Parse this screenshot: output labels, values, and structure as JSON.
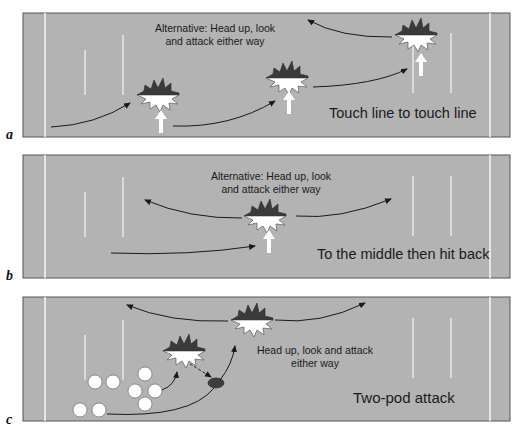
{
  "figure": {
    "colors": {
      "field": "#b3b3b3",
      "field_border": "#555555",
      "lines": "#f2f2f2",
      "burst_dark": "#3a3a3a",
      "burst_light": "#ffffff",
      "arrow": "#1a1a1a",
      "ball": "#3d3d3d",
      "player": "#ffffff"
    },
    "panels": [
      {
        "label": "a",
        "caption": "Touch line to touch line",
        "note_line1": "Alternative: Head up, look",
        "note_line2": "and attack either way",
        "contact_points": 3
      },
      {
        "label": "b",
        "caption": "To the middle then hit back",
        "note_line1": "Alternative: Head up, look",
        "note_line2": "and attack either way",
        "contact_points": 1
      },
      {
        "label": "c",
        "caption": "Two-pod attack",
        "note_line1": "Head up, look and attack",
        "note_line2": "either way",
        "contact_points": 2,
        "players": 10,
        "ball": 1
      }
    ]
  }
}
